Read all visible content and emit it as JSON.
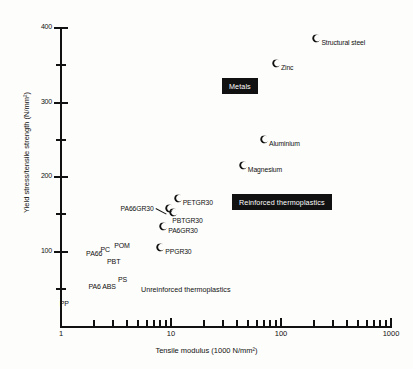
{
  "chart_data": {
    "type": "scatter",
    "title": "",
    "xlabel": "Tensile modulus (1000 N/mm²)",
    "ylabel": "Yield stress/tensile strength (N/mm²)",
    "xscale": "log",
    "yscale": "linear",
    "xlim": [
      1,
      1000
    ],
    "ylim": [
      0,
      400
    ],
    "grid": false,
    "legend": "none",
    "xticks_major": [
      {
        "value": 1,
        "label": "1"
      },
      {
        "value": 10,
        "label": "10"
      },
      {
        "value": 100,
        "label": "100"
      },
      {
        "value": 1000,
        "label": "1000"
      }
    ],
    "xticks_minor": [
      2,
      3,
      4,
      5,
      6,
      7,
      8,
      9,
      20,
      30,
      40,
      50,
      60,
      70,
      80,
      90,
      200,
      300,
      400,
      500,
      600,
      700,
      800,
      900
    ],
    "yticks_major": [
      {
        "value": 100,
        "label": "100"
      },
      {
        "value": 200,
        "label": "200"
      },
      {
        "value": 300,
        "label": "300"
      },
      {
        "value": 400,
        "label": "400"
      }
    ],
    "yticks_minor": [
      50,
      150,
      250,
      350
    ],
    "marker_style": "filled-crescent",
    "points": [
      {
        "name": "Structural steel",
        "x": 210,
        "y": 385,
        "label_side": "right",
        "has_marker": true
      },
      {
        "name": "Zinc",
        "x": 90,
        "y": 352,
        "label_side": "right",
        "has_marker": true
      },
      {
        "name": "Aluminium",
        "x": 70,
        "y": 250,
        "label_side": "right",
        "has_marker": true
      },
      {
        "name": "Magnesium",
        "x": 45,
        "y": 215,
        "label_side": "right",
        "has_marker": true
      },
      {
        "name": "PETGR30",
        "x": 11.5,
        "y": 170,
        "label_side": "right",
        "has_marker": true
      },
      {
        "name": "PBTGR30",
        "x": 10.5,
        "y": 152,
        "label_side": "below-right",
        "has_marker": true
      },
      {
        "name": "PA66GR30",
        "x": 9.5,
        "y": 157,
        "label_side": "left-leader",
        "has_marker": true
      },
      {
        "name": "PA6GR30",
        "x": 8.5,
        "y": 133,
        "label_side": "right",
        "has_marker": true
      },
      {
        "name": "PPGR30",
        "x": 8.0,
        "y": 105,
        "label_side": "right",
        "has_marker": true
      },
      {
        "name": "POM",
        "x": 3.6,
        "y": 108,
        "label_side": "text-only",
        "has_marker": false
      },
      {
        "name": "PC",
        "x": 2.7,
        "y": 102,
        "label_side": "text-only",
        "has_marker": false
      },
      {
        "name": "PA66",
        "x": 2.0,
        "y": 96,
        "label_side": "text-only",
        "has_marker": false
      },
      {
        "name": "PBT",
        "x": 3.1,
        "y": 86,
        "label_side": "text-only",
        "has_marker": false
      },
      {
        "name": "PS",
        "x": 3.9,
        "y": 62,
        "label_side": "text-only",
        "has_marker": false
      },
      {
        "name": "ABS",
        "x": 2.8,
        "y": 53,
        "label_side": "text-only",
        "has_marker": false
      },
      {
        "name": "PA6",
        "x": 2.1,
        "y": 52,
        "label_side": "text-only",
        "has_marker": false
      },
      {
        "name": "PP",
        "x": 1.15,
        "y": 30,
        "label_side": "text-only",
        "has_marker": false
      }
    ],
    "group_labels": [
      {
        "text": "Metals",
        "style": "inverted-box",
        "x": 222,
        "y": 78
      },
      {
        "text": "Reinforced thermoplastics",
        "style": "inverted-box",
        "x": 232,
        "y": 194
      },
      {
        "text": "Unreinforced thermoplastics",
        "style": "plain",
        "x": 141,
        "y": 285
      }
    ],
    "colors": {
      "ink": "#111111",
      "background": "#fdfdfb",
      "box_fill": "#111111",
      "box_text": "#ffffff"
    }
  }
}
